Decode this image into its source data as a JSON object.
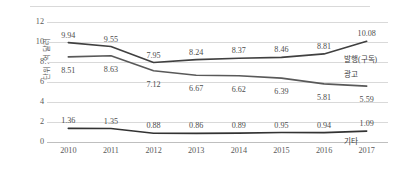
{
  "chart_data": {
    "type": "line",
    "title": "",
    "subtitle": "",
    "xlabel": "",
    "ylabel": "단위 : 억 달러",
    "categories": [
      "2010",
      "2011",
      "2012",
      "2013",
      "2014",
      "2015",
      "2016",
      "2017"
    ],
    "ylim": [
      0,
      12
    ],
    "yticks": [
      "0",
      "2",
      "4",
      "6",
      "8",
      "10",
      "12"
    ],
    "grid": true,
    "legend_position": "right-inline",
    "series": [
      {
        "name": "발행(구독)",
        "values": [
          9.94,
          9.55,
          7.95,
          8.24,
          8.37,
          8.46,
          8.81,
          10.08
        ],
        "labels": [
          "9.94",
          "9.55",
          "7.95",
          "8.24",
          "8.37",
          "8.46",
          "8.81",
          "10.08"
        ],
        "color": "#404040"
      },
      {
        "name": "광고",
        "values": [
          8.51,
          8.63,
          7.12,
          6.67,
          6.62,
          6.39,
          5.81,
          5.59
        ],
        "labels": [
          "8.51",
          "8.63",
          "7.12",
          "6.67",
          "6.62",
          "6.39",
          "5.81",
          "5.59"
        ],
        "color": "#595959"
      },
      {
        "name": "기타",
        "values": [
          1.36,
          1.35,
          0.88,
          0.86,
          0.89,
          0.95,
          0.94,
          1.09
        ],
        "labels": [
          "1.36",
          "1.35",
          "0.88",
          "0.86",
          "0.89",
          "0.95",
          "0.94",
          "1.09"
        ],
        "color": "#333333"
      }
    ]
  },
  "colors": {
    "grid": "#d9d9d9",
    "axis_text": "#5a5a5a",
    "label_text": "#4d4d4d",
    "background": "#ffffff"
  }
}
